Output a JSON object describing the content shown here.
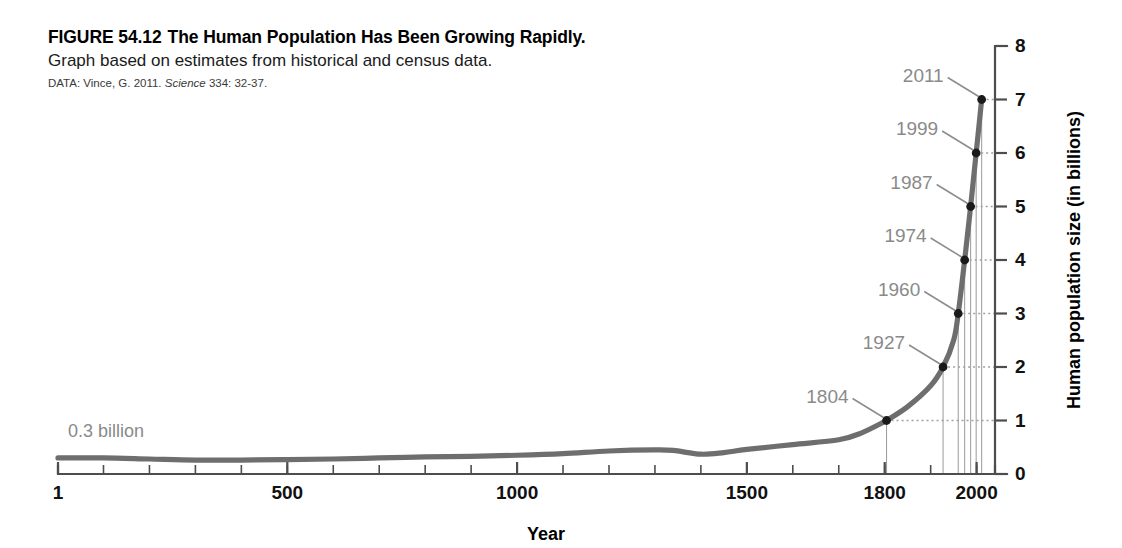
{
  "figure": {
    "number": "FIGURE 54.12",
    "title": "The Human Population Has Been Growing Rapidly.",
    "subtitle": "Graph based on estimates from historical and census data.",
    "source_prefix": "DATA: Vince, G. 2011.",
    "source_italic": "Science",
    "source_suffix": "334: 32-37."
  },
  "colors": {
    "curve": "#6e6e6e",
    "axis": "#4d4d4d",
    "label_gray": "#8a8a8a",
    "dot": "#1a1a1a",
    "guide": "#a0a0a0"
  },
  "chart_data": {
    "type": "line",
    "title": "The Human Population Has Been Growing Rapidly.",
    "xlabel": "Year",
    "ylabel": "Human population size (in billions)",
    "xlim": [
      1,
      2040
    ],
    "ylim": [
      0,
      8
    ],
    "grid": false,
    "legend": null,
    "x_ticks_major": [
      1,
      500,
      1000,
      1500,
      1800,
      2000
    ],
    "x_tick_labels": [
      "1",
      "500",
      "1000",
      "1500",
      "1800",
      "2000"
    ],
    "x_ticks_minor_step": 100,
    "y_ticks": [
      0,
      1,
      2,
      3,
      4,
      5,
      6,
      7,
      8
    ],
    "y_tick_labels": [
      "0",
      "1",
      "2",
      "3",
      "4",
      "5",
      "6",
      "7",
      "8"
    ],
    "series": [
      {
        "name": "Human population size",
        "x": [
          1,
          100,
          200,
          300,
          400,
          500,
          600,
          700,
          800,
          900,
          1000,
          1100,
          1200,
          1300,
          1340,
          1400,
          1450,
          1500,
          1600,
          1700,
          1750,
          1800,
          1804,
          1850,
          1900,
          1927,
          1950,
          1960,
          1974,
          1987,
          1999,
          2011
        ],
        "y": [
          0.3,
          0.3,
          0.28,
          0.26,
          0.26,
          0.27,
          0.28,
          0.3,
          0.32,
          0.33,
          0.35,
          0.38,
          0.43,
          0.45,
          0.44,
          0.37,
          0.4,
          0.46,
          0.55,
          0.64,
          0.77,
          0.98,
          1.0,
          1.26,
          1.65,
          2.0,
          2.5,
          3.0,
          4.0,
          5.0,
          6.0,
          7.0
        ]
      }
    ],
    "annotations": [
      {
        "text": "0.3 billion",
        "x": 1,
        "y": 0.3,
        "kind": "text-note"
      }
    ],
    "callouts": [
      {
        "label": "1804",
        "year": 1804,
        "value": 1
      },
      {
        "label": "1927",
        "year": 1927,
        "value": 2
      },
      {
        "label": "1960",
        "year": 1960,
        "value": 3
      },
      {
        "label": "1974",
        "year": 1974,
        "value": 4
      },
      {
        "label": "1987",
        "year": 1987,
        "value": 5
      },
      {
        "label": "1999",
        "year": 1999,
        "value": 6
      },
      {
        "label": "2011",
        "year": 2011,
        "value": 7
      }
    ]
  }
}
